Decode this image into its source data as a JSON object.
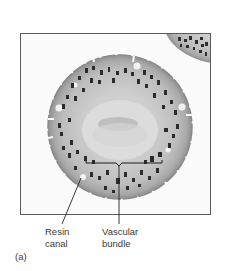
{
  "figure": {
    "panel_label": "(a)",
    "labels": [
      {
        "id": "resin-canal",
        "line1": "Resin",
        "line2": "canal"
      },
      {
        "id": "vascular-bundle",
        "line1": "Vascular",
        "line2": "bundle"
      }
    ],
    "colors": {
      "frame": "#5a5a5a",
      "tissue_outer": "#9a9a9a",
      "tissue_mid": "#c8c8c8",
      "cells_dark": "#2a2a2a",
      "center": "#d9d9d9",
      "leader": "#222222"
    }
  }
}
